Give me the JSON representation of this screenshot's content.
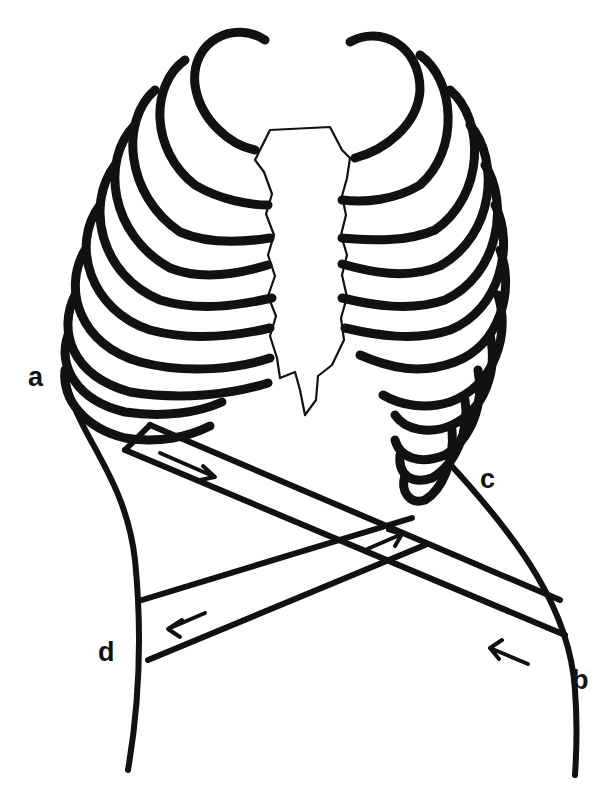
{
  "diagram": {
    "colors": {
      "ink": "#111111",
      "background": "#ffffff"
    },
    "labels": [
      {
        "id": "a",
        "text": "a",
        "x": 30,
        "y": 365
      },
      {
        "id": "b",
        "text": "b",
        "x": 572,
        "y": 673
      },
      {
        "id": "c",
        "text": "c",
        "x": 478,
        "y": 468
      },
      {
        "id": "d",
        "text": "d",
        "x": 97,
        "y": 642
      }
    ],
    "straps": [
      {
        "from": "a",
        "to": "b",
        "arrows": [
          "right-down arrow near a",
          "left-up arrow near b"
        ]
      },
      {
        "from": "c",
        "to": "d",
        "arrows": [
          "right-up arrow near c",
          "left arrow near d"
        ]
      }
    ],
    "rib_pairs": 10
  }
}
